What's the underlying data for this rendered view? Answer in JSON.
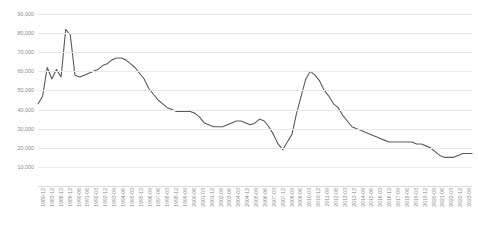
{
  "chart_data": {
    "type": "line",
    "title": "",
    "subtitle": "",
    "xlabel": "",
    "ylabel": "",
    "ylim": [
      0,
      90000
    ],
    "yticks": [
      90000,
      80000,
      70000,
      60000,
      50000,
      40000,
      30000,
      20000,
      10000
    ],
    "ytick_labels": [
      "90,000",
      "80,000",
      "70,000",
      "60,000",
      "50,000",
      "40,000",
      "30,000",
      "20,000",
      "10,000"
    ],
    "grid": true,
    "legend": false,
    "legend_position": "none",
    "line_color": "#5a5a5a",
    "gridline_color": "#e8e8e8",
    "tick_label_color": "#8c8c8c",
    "background_color": "#ffffff",
    "xtick_labels": [
      "1980-12",
      "1983-12",
      "1986-12",
      "1989-12",
      "1990-06",
      "1991-06",
      "1992-03",
      "1992-12",
      "1993-09",
      "1994-06",
      "1995-03",
      "1995-12",
      "1996-09",
      "1997-06",
      "1998-03",
      "1998-12",
      "1999-09",
      "2000-06",
      "2001-03",
      "2001-12",
      "2002-09",
      "2003-06",
      "2004-03",
      "2004-12",
      "2005-09",
      "2006-06",
      "2007-03",
      "2007-12",
      "2008-09",
      "2009-06",
      "2010-03",
      "2010-12",
      "2011-09",
      "2012-06",
      "2013-03",
      "2013-12",
      "2014-09",
      "2015-06",
      "2016-03",
      "2016-12",
      "2017-09",
      "2018-06",
      "2019-03",
      "2019-12",
      "2020-09",
      "2021-06",
      "2022-03",
      "2022-12",
      "2023-09"
    ],
    "categories": [
      "1980-12",
      "1982-06",
      "1983-12",
      "1985-06",
      "1986-12",
      "1988-06",
      "1989-12",
      "1990-06",
      "1990-12",
      "1991-06",
      "1991-12",
      "1992-03",
      "1992-09",
      "1992-12",
      "1993-06",
      "1993-09",
      "1994-03",
      "1994-06",
      "1994-12",
      "1995-03",
      "1995-09",
      "1995-12",
      "1996-06",
      "1996-09",
      "1997-03",
      "1997-06",
      "1997-12",
      "1998-03",
      "1998-09",
      "1998-12",
      "1999-06",
      "1999-09",
      "2000-03",
      "2000-06",
      "2000-12",
      "2001-03",
      "2001-09",
      "2001-12",
      "2002-06",
      "2002-09",
      "2003-03",
      "2003-06",
      "2003-12",
      "2004-03",
      "2004-09",
      "2004-12",
      "2005-06",
      "2005-09",
      "2006-03",
      "2006-06",
      "2006-12",
      "2007-03",
      "2007-09",
      "2007-12",
      "2008-06",
      "2008-09",
      "2009-03",
      "2009-06",
      "2009-12",
      "2010-03",
      "2010-09",
      "2010-12",
      "2011-06",
      "2011-09",
      "2012-03",
      "2012-06",
      "2012-12",
      "2013-03",
      "2013-09",
      "2013-12",
      "2014-06",
      "2014-09",
      "2015-03",
      "2015-06",
      "2015-12",
      "2016-03",
      "2016-09",
      "2016-12",
      "2017-06",
      "2017-09",
      "2018-03",
      "2018-06",
      "2018-12",
      "2019-03",
      "2019-09",
      "2019-12",
      "2020-06",
      "2020-09",
      "2021-03",
      "2021-06",
      "2021-12",
      "2022-03",
      "2022-09",
      "2022-12",
      "2023-03"
    ],
    "values": [
      43000,
      47000,
      62000,
      56000,
      61000,
      57000,
      82000,
      79000,
      58000,
      57000,
      58000,
      59000,
      60000,
      61000,
      63000,
      64000,
      66000,
      67000,
      67000,
      66000,
      64000,
      62000,
      59000,
      56000,
      51000,
      48000,
      45000,
      43000,
      41000,
      40000,
      39000,
      39000,
      39000,
      39000,
      38000,
      36000,
      33000,
      32000,
      31000,
      31000,
      31000,
      32000,
      33000,
      34000,
      34000,
      33000,
      32000,
      33000,
      35000,
      34000,
      31000,
      27000,
      22000,
      19000,
      23000,
      27000,
      38000,
      47000,
      56000,
      60000,
      58000,
      55000,
      50000,
      47000,
      43000,
      41000,
      37000,
      34000,
      31000,
      30000,
      29000,
      28000,
      27000,
      26000,
      25000,
      24000,
      23000,
      23000,
      23000,
      23000,
      23000,
      23000,
      22000,
      22000,
      21000,
      20000,
      18000,
      16000,
      15000,
      15000,
      15000,
      16000,
      17000,
      17000,
      17000
    ]
  }
}
